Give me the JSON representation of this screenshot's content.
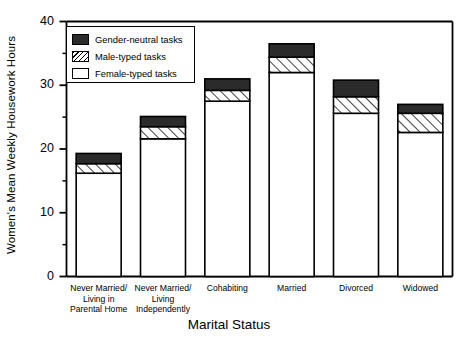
{
  "chart_data": {
    "type": "bar",
    "title": "",
    "xlabel": "Marital Status",
    "ylabel": "Women's Mean Weekly Housework Hours",
    "ylim": [
      0,
      40
    ],
    "ytick_values": [
      0,
      10,
      20,
      30,
      40
    ],
    "ytick_labels": [
      "0",
      "10",
      "20",
      "30",
      "40"
    ],
    "yminor_values": [
      5,
      15,
      25,
      35
    ],
    "grid": false,
    "stacked": true,
    "legend_position": "upper-left-inside",
    "categories": [
      "Never Married/\nLiving in\nParental Home",
      "Never Married/\nLiving\nIndependently",
      "Cohabiting",
      "Married",
      "Divorced",
      "Widowed"
    ],
    "series": [
      {
        "name": "Female-typed tasks",
        "fill": "white",
        "values": [
          16.2,
          21.6,
          27.5,
          32.0,
          25.6,
          22.6
        ]
      },
      {
        "name": "Male-typed tasks",
        "fill": "hatch",
        "values": [
          1.5,
          1.9,
          1.7,
          2.4,
          2.6,
          3.0
        ]
      },
      {
        "name": "Gender-neutral tasks",
        "fill": "dark",
        "values": [
          1.6,
          1.6,
          1.8,
          2.1,
          2.6,
          1.4
        ]
      }
    ],
    "totals": [
      19.3,
      25.1,
      31.0,
      36.5,
      30.8,
      27.0
    ]
  },
  "legend": {
    "items": [
      {
        "label": "Gender-neutral tasks",
        "swatch": "dark"
      },
      {
        "label": "Male-typed tasks",
        "swatch": "hatch"
      },
      {
        "label": "Female-typed tasks",
        "swatch": "white"
      }
    ]
  },
  "colors": {
    "axis": "#000000",
    "dark_fill": "#2b2b2b",
    "hatch_line": "#000000",
    "white_fill": "#ffffff",
    "background": "#ffffff"
  }
}
